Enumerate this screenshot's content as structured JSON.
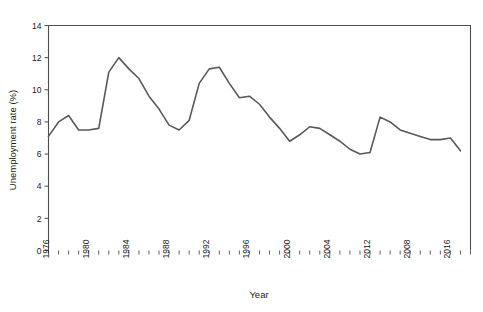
{
  "chart_data": {
    "type": "line",
    "title": "",
    "xlabel": "Year",
    "ylabel": "Unemployment rate (%)",
    "xlim": [
      1976,
      2018
    ],
    "ylim": [
      0,
      14
    ],
    "yticks": [
      0,
      2,
      4,
      6,
      8,
      10,
      12,
      14
    ],
    "ytick_labels": [
      "0",
      "2",
      "4",
      "6",
      "8",
      "10",
      "12",
      "14"
    ],
    "xticks": [
      1976,
      1980,
      1984,
      1988,
      1992,
      1996,
      2000,
      2004,
      2008,
      2012,
      2016
    ],
    "xtick_labels": [
      "1976",
      "1980",
      "1984",
      "1988",
      "1992",
      "1996",
      "2000",
      "2004",
      "2012",
      "2008",
      "2016"
    ],
    "xtick_minor_step": 1,
    "grid": false,
    "legend": "none",
    "line_color": "#595959",
    "axis_color": "#4d4d4d",
    "background": "#ffffff",
    "x": [
      1976,
      1977,
      1978,
      1979,
      1980,
      1981,
      1982,
      1983,
      1984,
      1985,
      1986,
      1987,
      1988,
      1989,
      1990,
      1991,
      1992,
      1993,
      1994,
      1995,
      1996,
      1997,
      1998,
      1999,
      2000,
      2001,
      2002,
      2003,
      2004,
      2005,
      2006,
      2007,
      2008,
      2009,
      2010,
      2011,
      2012,
      2013,
      2014,
      2015,
      2016,
      2017
    ],
    "values": [
      7.1,
      8.0,
      8.4,
      7.5,
      7.5,
      7.6,
      11.1,
      12.0,
      11.3,
      10.7,
      9.6,
      8.8,
      7.8,
      7.5,
      8.1,
      10.4,
      11.3,
      11.4,
      10.4,
      9.5,
      9.6,
      9.1,
      8.3,
      7.6,
      6.8,
      7.2,
      7.7,
      7.6,
      7.2,
      6.8,
      6.3,
      6.0,
      6.1,
      8.3,
      8.0,
      7.5,
      7.3,
      7.1,
      6.9,
      6.9,
      7.0,
      6.2
    ],
    "annotations": []
  }
}
